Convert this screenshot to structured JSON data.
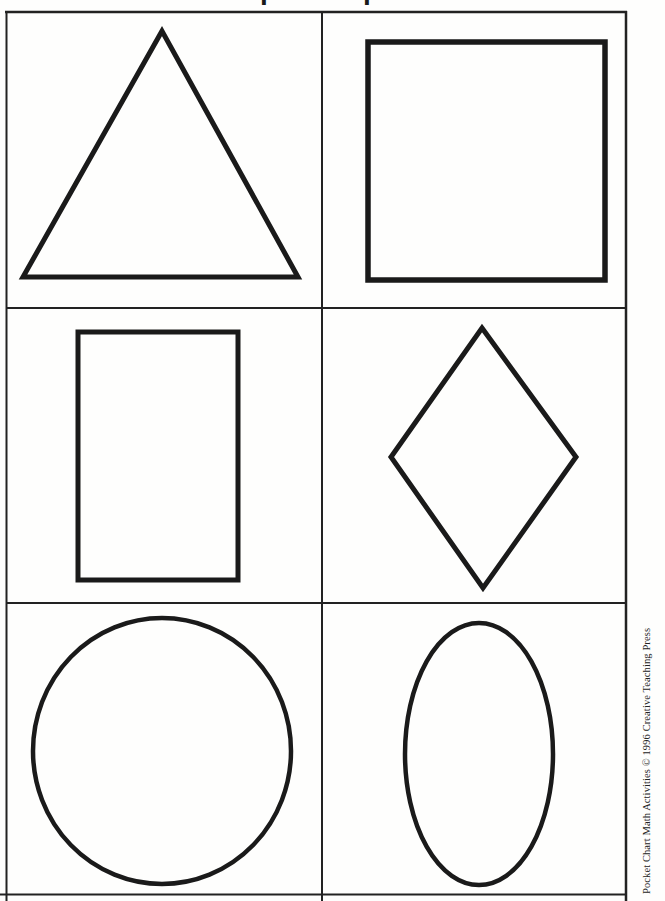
{
  "page": {
    "title": "Simple Shapes",
    "copyright": "Pocket Chart Math Activities © 1996 Creative Teaching Press"
  },
  "colors": {
    "ink": "#1a1a1a",
    "paper": "#fefefd"
  },
  "grid": {
    "visible_rows": 3,
    "columns": 2
  },
  "cards": [
    {
      "shape": "triangle",
      "row": 1,
      "col": 1
    },
    {
      "shape": "square",
      "row": 1,
      "col": 2
    },
    {
      "shape": "rectangle",
      "row": 2,
      "col": 1
    },
    {
      "shape": "diamond",
      "row": 2,
      "col": 2
    },
    {
      "shape": "circle",
      "row": 3,
      "col": 1
    },
    {
      "shape": "oval",
      "row": 3,
      "col": 2
    }
  ]
}
